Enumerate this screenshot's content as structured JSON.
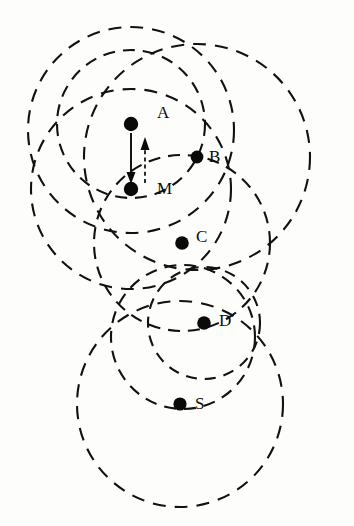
{
  "figure": {
    "background_color": "#fdfdfc",
    "stroke_color": "#111111",
    "dot_color": "#0a0a0a",
    "width": 354,
    "height": 526
  },
  "nodes": [
    {
      "id": "A",
      "label": "A",
      "dot_x": 131,
      "dot_y": 124,
      "label_x": 157,
      "label_y": 114,
      "radius": 74
    },
    {
      "id": "B",
      "label": "B",
      "dot_x": 197,
      "dot_y": 157,
      "label_x": 209,
      "label_y": 158,
      "radius": 113
    },
    {
      "id": "M",
      "label": "M",
      "dot_x": 131,
      "dot_y": 189,
      "label_x": 157,
      "label_y": 190,
      "radius": 100
    },
    {
      "id": "C",
      "label": "C",
      "dot_x": 182,
      "dot_y": 243,
      "label_x": 196,
      "label_y": 238,
      "radius": 88
    },
    {
      "id": "D",
      "label": "D",
      "dot_x": 204,
      "dot_y": 323,
      "label_x": 219,
      "label_y": 322,
      "radius": 56
    },
    {
      "id": "S",
      "label": "S",
      "dot_x": 180,
      "dot_y": 404,
      "label_x": 195,
      "label_y": 405,
      "radius": 103
    }
  ],
  "extra_circles": [
    {
      "id": "outer-left",
      "cx": 131,
      "cy": 130,
      "r": 103
    },
    {
      "id": "s-inner",
      "cx": 183,
      "cy": 337,
      "r": 72
    }
  ],
  "arrows": [
    {
      "id": "arrow-a-to-m",
      "style": "solid",
      "direction": "down",
      "from_x": 131,
      "from_y": 133,
      "to_x": 131,
      "to_y": 181
    },
    {
      "id": "arrow-m-to-a",
      "style": "dashed",
      "direction": "up",
      "from_x": 145,
      "from_y": 182,
      "to_x": 145,
      "to_y": 139
    }
  ],
  "legend": {
    "solid_arrow_meaning": "A to M",
    "dashed_arrow_meaning": "M to A"
  }
}
